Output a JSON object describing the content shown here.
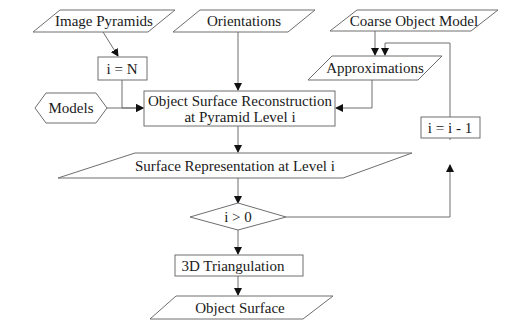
{
  "diagram": {
    "type": "flowchart",
    "nodes": {
      "image_pyramids": {
        "label": "Image Pyramids",
        "shape": "parallelogram"
      },
      "orientations": {
        "label": "Orientations",
        "shape": "parallelogram"
      },
      "coarse_object_model": {
        "label": "Coarse Object Model",
        "shape": "parallelogram"
      },
      "i_equals_n": {
        "label": "i = N",
        "shape": "rectangle"
      },
      "approximations": {
        "label": "Approximations",
        "shape": "parallelogram"
      },
      "models": {
        "label": "Models",
        "shape": "hexagon"
      },
      "reconstruction_line1": {
        "label": "Object Surface Reconstruction",
        "shape": "rectangle"
      },
      "reconstruction_line2": {
        "label": "at Pyramid Level i",
        "shape": "rectangle"
      },
      "decrement": {
        "label": "i = i - 1",
        "shape": "rectangle"
      },
      "surface_representation": {
        "label": "Surface Representation at Level i",
        "shape": "parallelogram"
      },
      "condition": {
        "label": "i > 0",
        "shape": "diamond"
      },
      "triangulation": {
        "label": "3D Triangulation",
        "shape": "rectangle"
      },
      "object_surface": {
        "label": "Object Surface",
        "shape": "parallelogram"
      }
    },
    "edges": [
      {
        "from": "Image Pyramids",
        "to": "i = N"
      },
      {
        "from": "i = N",
        "to": "Object Surface Reconstruction"
      },
      {
        "from": "Models",
        "to": "Object Surface Reconstruction"
      },
      {
        "from": "Orientations",
        "to": "Object Surface Reconstruction"
      },
      {
        "from": "Coarse Object Model",
        "to": "Approximations"
      },
      {
        "from": "Approximations",
        "to": "Object Surface Reconstruction"
      },
      {
        "from": "Object Surface Reconstruction",
        "to": "Surface Representation at Level i"
      },
      {
        "from": "Surface Representation at Level i",
        "to": "i > 0"
      },
      {
        "from": "i > 0",
        "to": "i = i - 1"
      },
      {
        "from": "i = i - 1",
        "to": "Approximations"
      },
      {
        "from": "i > 0",
        "to": "3D Triangulation"
      },
      {
        "from": "3D Triangulation",
        "to": "Object Surface"
      }
    ]
  }
}
